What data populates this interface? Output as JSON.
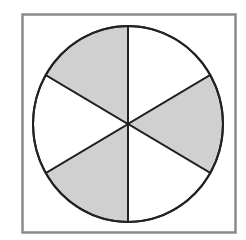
{
  "diagram": {
    "type": "fraction-circle",
    "sectors_total": 6,
    "sectors_shaded": 3,
    "shaded_fraction": "3/6",
    "colors": {
      "frame": "#8a8a8a",
      "outline": "#222222",
      "shaded": "#d0d0d0",
      "unshaded": "#ffffff"
    },
    "sectors": [
      {
        "index": 0,
        "from_deg": -90,
        "to_deg": -30,
        "shaded": false
      },
      {
        "index": 1,
        "from_deg": -30,
        "to_deg": 30,
        "shaded": true
      },
      {
        "index": 2,
        "from_deg": 30,
        "to_deg": 90,
        "shaded": false
      },
      {
        "index": 3,
        "from_deg": 90,
        "to_deg": 150,
        "shaded": true
      },
      {
        "index": 4,
        "from_deg": 150,
        "to_deg": 210,
        "shaded": false
      },
      {
        "index": 5,
        "from_deg": 210,
        "to_deg": 270,
        "shaded": true
      }
    ]
  }
}
